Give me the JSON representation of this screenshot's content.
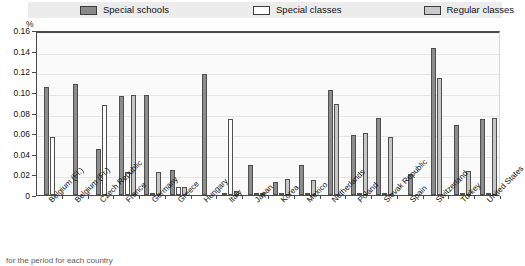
{
  "legend": {
    "items": [
      {
        "label": "Special schools",
        "key": "special_schools",
        "color": "#8a8a8a"
      },
      {
        "label": "Special classes",
        "key": "special_classes",
        "color": "#fdfdfd"
      },
      {
        "label": "Regular classes",
        "key": "regular_classes",
        "color": "#c9c9c9"
      }
    ]
  },
  "axis": {
    "unit_label": "%",
    "yticks": [
      "0.16",
      "0.14",
      "0.12",
      "0.10",
      "0.08",
      "0.06",
      "0.04",
      "0.02",
      "0"
    ]
  },
  "caption": {
    "text": "for the period for each country"
  },
  "chart_data": {
    "type": "bar",
    "title": "",
    "xlabel": "",
    "ylabel": "%",
    "ylim": [
      0,
      0.16
    ],
    "ytick_values": [
      0,
      0.02,
      0.04,
      0.06,
      0.08,
      0.1,
      0.12,
      0.14,
      0.16
    ],
    "grid": true,
    "legend_position": "top",
    "categories": [
      "Belgium (Fl.)",
      "Belgium (Fr.)",
      "Czech Republic",
      "France",
      "Germany",
      "Greece",
      "Hungary",
      "Italy",
      "Japan",
      "Korea",
      "Mexico",
      "Netherlands",
      "Poland",
      "Slovak Republic",
      "Spain",
      "Switzerland",
      "Turkey",
      "United States"
    ],
    "series": [
      {
        "name": "Special schools",
        "color": "#8c8c8c",
        "values": [
          0.105,
          0.108,
          0.045,
          0.096,
          0.097,
          0.024,
          0.117,
          0.001,
          0.029,
          0.013,
          0.029,
          0.102,
          0.058,
          0.075,
          0.02,
          0.143,
          0.068,
          0.074
        ]
      },
      {
        "name": "Special classes",
        "color": "#fcfcfc",
        "values": [
          0.056,
          null,
          0.087,
          0.022,
          0.0,
          0.008,
          null,
          0.074,
          0.0,
          0.0,
          0.0,
          null,
          0.0,
          0.0,
          null,
          null,
          0.0,
          0.0
        ]
      },
      {
        "name": "Regular classes",
        "color": "#c6c6c6",
        "values": [
          null,
          null,
          null,
          0.097,
          0.022,
          0.008,
          null,
          0.004,
          0.0,
          0.016,
          0.015,
          0.088,
          0.06,
          0.056,
          null,
          0.113,
          0.023,
          0.075
        ]
      }
    ]
  }
}
